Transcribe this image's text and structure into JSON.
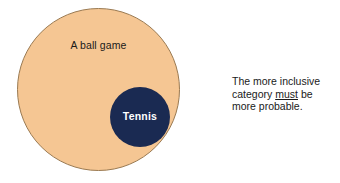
{
  "diagram": {
    "type": "euler-nested-sets",
    "background_color": "#ffffff",
    "outer_set": {
      "label": "A ball game",
      "fill_color": "#f5c693",
      "stroke_color": "#9a7a52",
      "center": [
        99,
        90
      ],
      "diameter": 163,
      "role": "superordinate-category"
    },
    "inner_set": {
      "label": "Tennis",
      "fill_color": "#1a2a52",
      "text_color": "#ffffff",
      "center": [
        122,
        108
      ],
      "diameter": 60,
      "role": "subset-category"
    }
  },
  "caption": {
    "line1": "The more inclusive",
    "line2_before": "category ",
    "line2_emphasis": "must",
    "line2_after": " be",
    "line3": "more probable.",
    "full_text": "The more inclusive category must be more probable."
  }
}
